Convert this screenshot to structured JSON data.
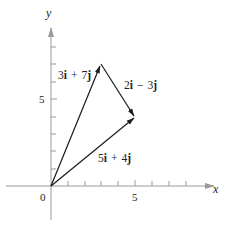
{
  "diagram": {
    "type": "vector-addition",
    "axes": {
      "x_label": "x",
      "y_label": "y",
      "origin_label": "0",
      "x_tick_label": "5",
      "y_tick_label": "5",
      "axis_color": "#9a9a9a"
    },
    "vectors": [
      {
        "name": "u",
        "from": [
          0,
          0
        ],
        "to": [
          3,
          7
        ],
        "coef_i": "3",
        "op": "+",
        "coef_j": "7",
        "label": "3i + 7j"
      },
      {
        "name": "v",
        "from": [
          3,
          7
        ],
        "to": [
          5,
          4
        ],
        "coef_i": "2",
        "op": "−",
        "coef_j": "3",
        "label": "2i − 3j"
      },
      {
        "name": "sum",
        "from": [
          0,
          0
        ],
        "to": [
          5,
          4
        ],
        "coef_i": "5",
        "op": "+",
        "coef_j": "4",
        "label": "5i + 4j"
      }
    ],
    "unit_i": "i",
    "unit_j": "j",
    "vector_color": "#1a1a1a"
  }
}
